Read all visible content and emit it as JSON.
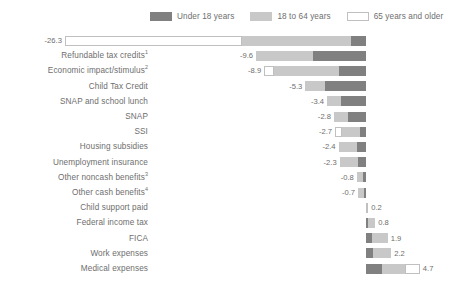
{
  "legend": {
    "items": [
      {
        "label": "Under 18 years",
        "color": "#808080",
        "border": "#808080",
        "icon": "legend-swatch-under18"
      },
      {
        "label": "18 to 64 years",
        "color": "#c8c8c8",
        "border": "#c8c8c8",
        "icon": "legend-swatch-18to64"
      },
      {
        "label": "65 years and older",
        "color": "#ffffff",
        "border": "#c0c0c0",
        "icon": "legend-swatch-65plus"
      }
    ]
  },
  "chart_data": {
    "type": "bar",
    "orientation": "horizontal",
    "stacked": true,
    "title": "",
    "xlabel": "",
    "ylabel": "",
    "xlim": [
      -26.3,
      4.7
    ],
    "grid": false,
    "legend_position": "top",
    "legend_entries": [
      "Under 18 years",
      "18 to 64 years",
      "65 years and older"
    ],
    "series": [
      {
        "name": "Under 18 years",
        "color": "#808080",
        "values": [
          -1.3,
          -4.6,
          -2.4,
          -3.6,
          -2.2,
          -1.6,
          -0.5,
          -0.8,
          -0.7,
          -0.3,
          -0.2,
          0.05,
          0.2,
          0.5,
          0.6,
          1.4
        ]
      },
      {
        "name": "18 to 64 years",
        "color": "#c8c8c8",
        "values": [
          -9.5,
          -5.0,
          -5.6,
          -1.7,
          -1.2,
          -1.2,
          -1.6,
          -1.6,
          -1.6,
          -0.5,
          -0.5,
          0.1,
          0.6,
          1.4,
          1.6,
          2.0
        ]
      },
      {
        "name": "65 years and older",
        "color": "#ffffff",
        "values": [
          -15.5,
          0.0,
          -0.9,
          0.0,
          0.0,
          0.0,
          -0.6,
          0.0,
          0.0,
          0.0,
          0.0,
          0.05,
          0.0,
          0.0,
          0.0,
          1.3
        ]
      }
    ],
    "categories": [
      "Social Security",
      "Refundable tax credits",
      "Economic impact/stimulus",
      "Child Tax Credit",
      "SNAP and school lunch",
      "SNAP",
      "SSI",
      "Housing subsidies",
      "Unemployment insurance",
      "Other noncash benefits",
      "Other cash benefits",
      "Child support paid",
      "Federal income tax",
      "FICA",
      "Work expenses",
      "Medical expenses"
    ],
    "totals": [
      -26.3,
      -9.6,
      -8.9,
      -5.3,
      -3.4,
      -2.8,
      -2.7,
      -2.4,
      -2.3,
      -0.8,
      -0.7,
      0.2,
      0.8,
      1.9,
      2.2,
      4.7
    ],
    "data_labels": [
      "-26.3",
      "-9.6",
      "-8.9",
      "-5.3",
      "-3.4",
      "-2.8",
      "-2.7",
      "-2.4",
      "-2.3",
      "-0.8",
      "-0.7",
      "0.2",
      "0.8",
      "1.9",
      "2.2",
      "4.7"
    ]
  },
  "rows": [
    {
      "label": "Social Security",
      "footnote": "",
      "total": -26.3,
      "value_label": "-26.3",
      "segments": [
        {
          "series": 2,
          "value": 15.5
        },
        {
          "series": 1,
          "value": 9.5
        },
        {
          "series": 0,
          "value": 1.3
        }
      ]
    },
    {
      "label": "Refundable tax credits",
      "footnote": "1",
      "total": -9.6,
      "value_label": "-9.6",
      "segments": [
        {
          "series": 1,
          "value": 5.0
        },
        {
          "series": 0,
          "value": 4.6
        }
      ]
    },
    {
      "label": "Economic impact/stimulus",
      "footnote": "2",
      "total": -8.9,
      "value_label": "-8.9",
      "segments": [
        {
          "series": 2,
          "value": 0.9
        },
        {
          "series": 1,
          "value": 5.6
        },
        {
          "series": 0,
          "value": 2.4
        }
      ]
    },
    {
      "label": "Child Tax Credit",
      "footnote": "",
      "total": -5.3,
      "value_label": "-5.3",
      "segments": [
        {
          "series": 1,
          "value": 1.7
        },
        {
          "series": 0,
          "value": 3.6
        }
      ]
    },
    {
      "label": "SNAP and school lunch",
      "footnote": "",
      "total": -3.4,
      "value_label": "-3.4",
      "segments": [
        {
          "series": 1,
          "value": 1.2
        },
        {
          "series": 0,
          "value": 2.2
        }
      ]
    },
    {
      "label": "SNAP",
      "footnote": "",
      "total": -2.8,
      "value_label": "-2.8",
      "segments": [
        {
          "series": 1,
          "value": 1.2
        },
        {
          "series": 0,
          "value": 1.6
        }
      ]
    },
    {
      "label": "SSI",
      "footnote": "",
      "total": -2.7,
      "value_label": "-2.7",
      "segments": [
        {
          "series": 2,
          "value": 0.6
        },
        {
          "series": 1,
          "value": 1.6
        },
        {
          "series": 0,
          "value": 0.5
        }
      ]
    },
    {
      "label": "Housing subsidies",
      "footnote": "",
      "total": -2.4,
      "value_label": "-2.4",
      "segments": [
        {
          "series": 1,
          "value": 1.6
        },
        {
          "series": 0,
          "value": 0.8
        }
      ]
    },
    {
      "label": "Unemployment insurance",
      "footnote": "",
      "total": -2.3,
      "value_label": "-2.3",
      "segments": [
        {
          "series": 1,
          "value": 1.6
        },
        {
          "series": 0,
          "value": 0.7
        }
      ]
    },
    {
      "label": "Other noncash benefits",
      "footnote": "3",
      "total": -0.8,
      "value_label": "-0.8",
      "segments": [
        {
          "series": 1,
          "value": 0.5
        },
        {
          "series": 0,
          "value": 0.3
        }
      ]
    },
    {
      "label": "Other cash benefits",
      "footnote": "4",
      "total": -0.7,
      "value_label": "-0.7",
      "segments": [
        {
          "series": 1,
          "value": 0.5
        },
        {
          "series": 0,
          "value": 0.2
        }
      ]
    },
    {
      "label": "Child support paid",
      "footnote": "",
      "total": 0.2,
      "value_label": "0.2",
      "segments": [
        {
          "series": 0,
          "value": 0.05
        },
        {
          "series": 1,
          "value": 0.1
        },
        {
          "series": 2,
          "value": 0.05
        }
      ]
    },
    {
      "label": "Federal income tax",
      "footnote": "",
      "total": 0.8,
      "value_label": "0.8",
      "segments": [
        {
          "series": 0,
          "value": 0.2
        },
        {
          "series": 1,
          "value": 0.6
        }
      ]
    },
    {
      "label": "FICA",
      "footnote": "",
      "total": 1.9,
      "value_label": "1.9",
      "segments": [
        {
          "series": 0,
          "value": 0.5
        },
        {
          "series": 1,
          "value": 1.4
        }
      ]
    },
    {
      "label": "Work expenses",
      "footnote": "",
      "total": 2.2,
      "value_label": "2.2",
      "segments": [
        {
          "series": 0,
          "value": 0.6
        },
        {
          "series": 1,
          "value": 1.6
        }
      ]
    },
    {
      "label": "Medical expenses",
      "footnote": "",
      "total": 4.7,
      "value_label": "4.7",
      "segments": [
        {
          "series": 0,
          "value": 1.4
        },
        {
          "series": 1,
          "value": 2.0
        },
        {
          "series": 2,
          "value": 1.3
        }
      ]
    }
  ]
}
